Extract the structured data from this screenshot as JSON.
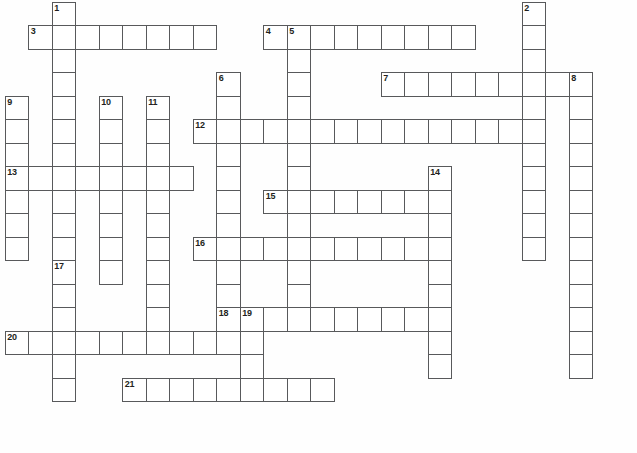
{
  "puzzle": {
    "type": "crossword-grid",
    "title": "Crossword puzzle grid",
    "geometry": {
      "cell_size": 23.5,
      "origin_x": 4.7,
      "origin_y": 1.7,
      "columns": 27,
      "rows": 19
    },
    "colors": {
      "grid_line": "#58595b",
      "cell_fill": "#ffffff",
      "number_text": "#231f20",
      "page_background": "#ffffff"
    },
    "entries": [
      {
        "number": "1",
        "direction": "down",
        "col": 3,
        "row": 1,
        "length": 9
      },
      {
        "number": "2",
        "direction": "down",
        "col": 23,
        "row": 1,
        "length": 10
      },
      {
        "number": "3",
        "direction": "across",
        "col": 2,
        "row": 2,
        "length": 8
      },
      {
        "number": "4",
        "direction": "across",
        "col": 12,
        "row": 2,
        "length": 9
      },
      {
        "number": "5",
        "direction": "down",
        "col": 13,
        "row": 2,
        "length": 13
      },
      {
        "number": "6",
        "direction": "down",
        "col": 10,
        "row": 4,
        "length": 15
      },
      {
        "number": "7",
        "direction": "across",
        "col": 17,
        "row": 4,
        "length": 9
      },
      {
        "number": "8",
        "direction": "down",
        "col": 25,
        "row": 4,
        "length": 13
      },
      {
        "number": "9",
        "direction": "down",
        "col": 1,
        "row": 5,
        "length": 8
      },
      {
        "number": "10",
        "direction": "down",
        "col": 5,
        "row": 5,
        "length": 9
      },
      {
        "number": "11",
        "direction": "down",
        "col": 7,
        "row": 5,
        "length": 13
      },
      {
        "number": "12",
        "direction": "across",
        "col": 9,
        "row": 6,
        "length": 14
      },
      {
        "number": "13",
        "direction": "across",
        "col": 1,
        "row": 8,
        "length": 8
      },
      {
        "number": "14",
        "direction": "down",
        "col": 19,
        "row": 8,
        "length": 9
      },
      {
        "number": "15",
        "direction": "across",
        "col": 12,
        "row": 9,
        "length": 8
      },
      {
        "number": "16",
        "direction": "across",
        "col": 9,
        "row": 11,
        "length": 11
      },
      {
        "number": "17",
        "direction": "down",
        "col": 3,
        "row": 12,
        "length": 6
      },
      {
        "number": "18",
        "direction": "across",
        "col": 10,
        "row": 14,
        "length": 10
      },
      {
        "number": "19",
        "direction": "down",
        "col": 11,
        "row": 14,
        "length": 5
      },
      {
        "number": "20",
        "direction": "across",
        "col": 1,
        "row": 15,
        "length": 11
      },
      {
        "number": "21",
        "direction": "across",
        "col": 6,
        "row": 17,
        "length": 9
      }
    ],
    "cells": [
      {
        "col": 3,
        "row": 1,
        "number": "1"
      },
      {
        "col": 23,
        "row": 1,
        "number": "2"
      },
      {
        "col": 2,
        "row": 2,
        "number": "3"
      },
      {
        "col": 3,
        "row": 2,
        "number": ""
      },
      {
        "col": 4,
        "row": 2,
        "number": ""
      },
      {
        "col": 5,
        "row": 2,
        "number": ""
      },
      {
        "col": 6,
        "row": 2,
        "number": ""
      },
      {
        "col": 7,
        "row": 2,
        "number": ""
      },
      {
        "col": 8,
        "row": 2,
        "number": ""
      },
      {
        "col": 9,
        "row": 2,
        "number": ""
      },
      {
        "col": 12,
        "row": 2,
        "number": "4"
      },
      {
        "col": 13,
        "row": 2,
        "number": "5"
      },
      {
        "col": 14,
        "row": 2,
        "number": ""
      },
      {
        "col": 15,
        "row": 2,
        "number": ""
      },
      {
        "col": 16,
        "row": 2,
        "number": ""
      },
      {
        "col": 17,
        "row": 2,
        "number": ""
      },
      {
        "col": 18,
        "row": 2,
        "number": ""
      },
      {
        "col": 19,
        "row": 2,
        "number": ""
      },
      {
        "col": 20,
        "row": 2,
        "number": ""
      },
      {
        "col": 23,
        "row": 2,
        "number": ""
      },
      {
        "col": 3,
        "row": 3,
        "number": ""
      },
      {
        "col": 13,
        "row": 3,
        "number": ""
      },
      {
        "col": 23,
        "row": 3,
        "number": ""
      },
      {
        "col": 3,
        "row": 4,
        "number": ""
      },
      {
        "col": 10,
        "row": 4,
        "number": "6"
      },
      {
        "col": 13,
        "row": 4,
        "number": ""
      },
      {
        "col": 17,
        "row": 4,
        "number": "7"
      },
      {
        "col": 18,
        "row": 4,
        "number": ""
      },
      {
        "col": 19,
        "row": 4,
        "number": ""
      },
      {
        "col": 20,
        "row": 4,
        "number": ""
      },
      {
        "col": 21,
        "row": 4,
        "number": ""
      },
      {
        "col": 22,
        "row": 4,
        "number": ""
      },
      {
        "col": 23,
        "row": 4,
        "number": ""
      },
      {
        "col": 24,
        "row": 4,
        "number": ""
      },
      {
        "col": 25,
        "row": 4,
        "number": "8"
      },
      {
        "col": 1,
        "row": 5,
        "number": "9"
      },
      {
        "col": 3,
        "row": 5,
        "number": ""
      },
      {
        "col": 5,
        "row": 5,
        "number": "10"
      },
      {
        "col": 7,
        "row": 5,
        "number": "11"
      },
      {
        "col": 10,
        "row": 5,
        "number": ""
      },
      {
        "col": 13,
        "row": 5,
        "number": ""
      },
      {
        "col": 23,
        "row": 5,
        "number": ""
      },
      {
        "col": 25,
        "row": 5,
        "number": ""
      },
      {
        "col": 1,
        "row": 6,
        "number": ""
      },
      {
        "col": 3,
        "row": 6,
        "number": ""
      },
      {
        "col": 5,
        "row": 6,
        "number": ""
      },
      {
        "col": 7,
        "row": 6,
        "number": ""
      },
      {
        "col": 9,
        "row": 6,
        "number": "12"
      },
      {
        "col": 10,
        "row": 6,
        "number": ""
      },
      {
        "col": 11,
        "row": 6,
        "number": ""
      },
      {
        "col": 12,
        "row": 6,
        "number": ""
      },
      {
        "col": 13,
        "row": 6,
        "number": ""
      },
      {
        "col": 14,
        "row": 6,
        "number": ""
      },
      {
        "col": 15,
        "row": 6,
        "number": ""
      },
      {
        "col": 16,
        "row": 6,
        "number": ""
      },
      {
        "col": 17,
        "row": 6,
        "number": ""
      },
      {
        "col": 18,
        "row": 6,
        "number": ""
      },
      {
        "col": 19,
        "row": 6,
        "number": ""
      },
      {
        "col": 20,
        "row": 6,
        "number": ""
      },
      {
        "col": 21,
        "row": 6,
        "number": ""
      },
      {
        "col": 22,
        "row": 6,
        "number": ""
      },
      {
        "col": 23,
        "row": 6,
        "number": ""
      },
      {
        "col": 25,
        "row": 6,
        "number": ""
      },
      {
        "col": 1,
        "row": 7,
        "number": ""
      },
      {
        "col": 3,
        "row": 7,
        "number": ""
      },
      {
        "col": 5,
        "row": 7,
        "number": ""
      },
      {
        "col": 7,
        "row": 7,
        "number": ""
      },
      {
        "col": 10,
        "row": 7,
        "number": ""
      },
      {
        "col": 13,
        "row": 7,
        "number": ""
      },
      {
        "col": 23,
        "row": 7,
        "number": ""
      },
      {
        "col": 25,
        "row": 7,
        "number": ""
      },
      {
        "col": 1,
        "row": 8,
        "number": "13"
      },
      {
        "col": 2,
        "row": 8,
        "number": ""
      },
      {
        "col": 3,
        "row": 8,
        "number": ""
      },
      {
        "col": 4,
        "row": 8,
        "number": ""
      },
      {
        "col": 5,
        "row": 8,
        "number": ""
      },
      {
        "col": 6,
        "row": 8,
        "number": ""
      },
      {
        "col": 7,
        "row": 8,
        "number": ""
      },
      {
        "col": 8,
        "row": 8,
        "number": ""
      },
      {
        "col": 10,
        "row": 8,
        "number": ""
      },
      {
        "col": 13,
        "row": 8,
        "number": ""
      },
      {
        "col": 19,
        "row": 8,
        "number": "14"
      },
      {
        "col": 23,
        "row": 8,
        "number": ""
      },
      {
        "col": 25,
        "row": 8,
        "number": ""
      },
      {
        "col": 1,
        "row": 9,
        "number": ""
      },
      {
        "col": 3,
        "row": 9,
        "number": ""
      },
      {
        "col": 5,
        "row": 9,
        "number": ""
      },
      {
        "col": 7,
        "row": 9,
        "number": ""
      },
      {
        "col": 10,
        "row": 9,
        "number": ""
      },
      {
        "col": 12,
        "row": 9,
        "number": "15"
      },
      {
        "col": 13,
        "row": 9,
        "number": ""
      },
      {
        "col": 14,
        "row": 9,
        "number": ""
      },
      {
        "col": 15,
        "row": 9,
        "number": ""
      },
      {
        "col": 16,
        "row": 9,
        "number": ""
      },
      {
        "col": 17,
        "row": 9,
        "number": ""
      },
      {
        "col": 18,
        "row": 9,
        "number": ""
      },
      {
        "col": 19,
        "row": 9,
        "number": ""
      },
      {
        "col": 23,
        "row": 9,
        "number": ""
      },
      {
        "col": 25,
        "row": 9,
        "number": ""
      },
      {
        "col": 1,
        "row": 10,
        "number": ""
      },
      {
        "col": 3,
        "row": 10,
        "number": ""
      },
      {
        "col": 5,
        "row": 10,
        "number": ""
      },
      {
        "col": 7,
        "row": 10,
        "number": ""
      },
      {
        "col": 10,
        "row": 10,
        "number": ""
      },
      {
        "col": 13,
        "row": 10,
        "number": ""
      },
      {
        "col": 19,
        "row": 10,
        "number": ""
      },
      {
        "col": 23,
        "row": 10,
        "number": ""
      },
      {
        "col": 25,
        "row": 10,
        "number": ""
      },
      {
        "col": 1,
        "row": 11,
        "number": ""
      },
      {
        "col": 3,
        "row": 11,
        "number": ""
      },
      {
        "col": 5,
        "row": 11,
        "number": ""
      },
      {
        "col": 7,
        "row": 11,
        "number": ""
      },
      {
        "col": 9,
        "row": 11,
        "number": "16"
      },
      {
        "col": 10,
        "row": 11,
        "number": ""
      },
      {
        "col": 11,
        "row": 11,
        "number": ""
      },
      {
        "col": 12,
        "row": 11,
        "number": ""
      },
      {
        "col": 13,
        "row": 11,
        "number": ""
      },
      {
        "col": 14,
        "row": 11,
        "number": ""
      },
      {
        "col": 15,
        "row": 11,
        "number": ""
      },
      {
        "col": 16,
        "row": 11,
        "number": ""
      },
      {
        "col": 17,
        "row": 11,
        "number": ""
      },
      {
        "col": 18,
        "row": 11,
        "number": ""
      },
      {
        "col": 19,
        "row": 11,
        "number": ""
      },
      {
        "col": 23,
        "row": 11,
        "number": ""
      },
      {
        "col": 25,
        "row": 11,
        "number": ""
      },
      {
        "col": 5,
        "row": 12,
        "number": ""
      },
      {
        "col": 7,
        "row": 12,
        "number": ""
      },
      {
        "col": 3,
        "row": 12,
        "number": "17"
      },
      {
        "col": 10,
        "row": 12,
        "number": ""
      },
      {
        "col": 13,
        "row": 12,
        "number": ""
      },
      {
        "col": 19,
        "row": 12,
        "number": ""
      },
      {
        "col": 25,
        "row": 12,
        "number": ""
      },
      {
        "col": 3,
        "row": 13,
        "number": ""
      },
      {
        "col": 7,
        "row": 13,
        "number": ""
      },
      {
        "col": 10,
        "row": 13,
        "number": ""
      },
      {
        "col": 13,
        "row": 13,
        "number": ""
      },
      {
        "col": 19,
        "row": 13,
        "number": ""
      },
      {
        "col": 25,
        "row": 13,
        "number": ""
      },
      {
        "col": 3,
        "row": 14,
        "number": ""
      },
      {
        "col": 7,
        "row": 14,
        "number": ""
      },
      {
        "col": 10,
        "row": 14,
        "number": "18"
      },
      {
        "col": 11,
        "row": 14,
        "number": "19"
      },
      {
        "col": 12,
        "row": 14,
        "number": ""
      },
      {
        "col": 13,
        "row": 14,
        "number": ""
      },
      {
        "col": 14,
        "row": 14,
        "number": ""
      },
      {
        "col": 15,
        "row": 14,
        "number": ""
      },
      {
        "col": 16,
        "row": 14,
        "number": ""
      },
      {
        "col": 17,
        "row": 14,
        "number": ""
      },
      {
        "col": 18,
        "row": 14,
        "number": ""
      },
      {
        "col": 19,
        "row": 14,
        "number": ""
      },
      {
        "col": 25,
        "row": 14,
        "number": ""
      },
      {
        "col": 1,
        "row": 15,
        "number": "20"
      },
      {
        "col": 2,
        "row": 15,
        "number": ""
      },
      {
        "col": 3,
        "row": 15,
        "number": ""
      },
      {
        "col": 4,
        "row": 15,
        "number": ""
      },
      {
        "col": 5,
        "row": 15,
        "number": ""
      },
      {
        "col": 6,
        "row": 15,
        "number": ""
      },
      {
        "col": 7,
        "row": 15,
        "number": ""
      },
      {
        "col": 8,
        "row": 15,
        "number": ""
      },
      {
        "col": 9,
        "row": 15,
        "number": ""
      },
      {
        "col": 10,
        "row": 15,
        "number": ""
      },
      {
        "col": 11,
        "row": 15,
        "number": ""
      },
      {
        "col": 19,
        "row": 15,
        "number": ""
      },
      {
        "col": 25,
        "row": 15,
        "number": ""
      },
      {
        "col": 3,
        "row": 16,
        "number": ""
      },
      {
        "col": 11,
        "row": 16,
        "number": ""
      },
      {
        "col": 19,
        "row": 16,
        "number": ""
      },
      {
        "col": 25,
        "row": 16,
        "number": ""
      },
      {
        "col": 3,
        "row": 17,
        "number": ""
      },
      {
        "col": 6,
        "row": 17,
        "number": "21"
      },
      {
        "col": 7,
        "row": 17,
        "number": ""
      },
      {
        "col": 8,
        "row": 17,
        "number": ""
      },
      {
        "col": 9,
        "row": 17,
        "number": ""
      },
      {
        "col": 10,
        "row": 17,
        "number": ""
      },
      {
        "col": 11,
        "row": 17,
        "number": ""
      },
      {
        "col": 12,
        "row": 17,
        "number": ""
      },
      {
        "col": 13,
        "row": 17,
        "number": ""
      },
      {
        "col": 14,
        "row": 17,
        "number": ""
      }
    ]
  }
}
